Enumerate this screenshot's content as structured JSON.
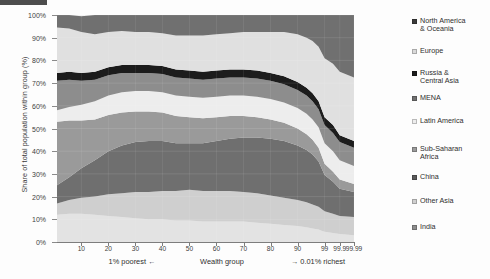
{
  "chart_data": {
    "type": "area",
    "title": "",
    "subtitle": "",
    "xlabel": "Wealth group",
    "ylabel": "Share of total population within group (%)",
    "stacked": true,
    "normalized": true,
    "grid": true,
    "legend_position": "right",
    "ylim": [
      0,
      100
    ],
    "ytick_labels": [
      "0%",
      "10%",
      "20%",
      "30%",
      "40%",
      "50%",
      "60%",
      "70%",
      "80%",
      "90%",
      "100%"
    ],
    "ytick_values": [
      0,
      10,
      20,
      30,
      40,
      50,
      60,
      70,
      80,
      90,
      100
    ],
    "xtick_labels": [
      "10",
      "20",
      "30",
      "40",
      "50",
      "60",
      "70",
      "80",
      "90",
      "99",
      "99.9",
      "99.99"
    ],
    "xtick_positions": [
      10,
      20,
      30,
      40,
      50,
      60,
      70,
      80,
      90,
      99,
      99.9,
      99.99
    ],
    "x_axis_note_left": "1% poorest ←",
    "x_axis_note_right": "→ 0.01% richest",
    "x": [
      0,
      5,
      10,
      15,
      20,
      25,
      30,
      35,
      40,
      45,
      50,
      55,
      60,
      65,
      70,
      75,
      80,
      85,
      90,
      93,
      95,
      97,
      98,
      99,
      99.5,
      99.9,
      99.99
    ],
    "series": [
      {
        "name": "India",
        "color": "#e3e3e3",
        "values": [
          12.0,
          12.5,
          12.5,
          12.0,
          11.5,
          11.0,
          10.5,
          10.0,
          10.0,
          9.5,
          9.5,
          9.0,
          9.0,
          9.0,
          9.0,
          8.5,
          8.0,
          7.5,
          7.0,
          6.5,
          6.0,
          5.5,
          5.0,
          4.5,
          4.0,
          3.5,
          3.0
        ]
      },
      {
        "name": "Other Asia",
        "color": "#cfcfcf",
        "values": [
          5.0,
          6.0,
          7.0,
          8.0,
          9.5,
          10.5,
          11.5,
          12.0,
          12.5,
          13.0,
          13.5,
          13.5,
          13.5,
          13.5,
          13.0,
          13.0,
          12.5,
          12.0,
          11.5,
          11.0,
          10.5,
          10.0,
          9.5,
          9.0,
          8.5,
          8.0,
          8.0
        ]
      },
      {
        "name": "China",
        "color": "#6f6f6f",
        "values": [
          8.0,
          10.0,
          13.0,
          16.0,
          19.0,
          21.0,
          22.0,
          22.5,
          22.0,
          21.0,
          20.5,
          21.0,
          22.0,
          23.0,
          24.0,
          24.5,
          25.0,
          25.0,
          24.0,
          23.0,
          22.0,
          20.0,
          18.0,
          16.0,
          14.0,
          12.0,
          11.0
        ]
      },
      {
        "name": "Sub-Saharan Africa",
        "color": "#9a9a9a",
        "values": [
          28.0,
          25.0,
          21.0,
          18.0,
          16.0,
          14.5,
          13.5,
          13.0,
          12.5,
          12.0,
          11.5,
          11.0,
          10.5,
          10.0,
          9.5,
          9.0,
          8.5,
          8.0,
          7.5,
          7.0,
          6.5,
          6.0,
          5.5,
          5.0,
          4.5,
          4.0,
          3.5
        ]
      },
      {
        "name": "Latin America",
        "color": "#ededed",
        "values": [
          5.0,
          6.0,
          7.0,
          8.0,
          8.5,
          9.0,
          9.0,
          9.0,
          9.0,
          9.0,
          9.0,
          9.0,
          9.0,
          9.0,
          9.0,
          9.0,
          9.0,
          9.0,
          9.0,
          9.0,
          9.0,
          9.0,
          9.0,
          9.0,
          9.0,
          8.5,
          8.0
        ]
      },
      {
        "name": "MENA",
        "color": "#8d8d8d",
        "values": [
          13.0,
          12.0,
          10.5,
          9.5,
          9.0,
          8.5,
          8.0,
          8.0,
          8.0,
          8.0,
          8.0,
          8.0,
          8.0,
          8.0,
          8.0,
          8.0,
          8.0,
          8.0,
          8.0,
          8.0,
          8.0,
          8.0,
          8.0,
          8.0,
          8.0,
          8.0,
          8.0
        ]
      },
      {
        "name": "Russia & Central Asia",
        "color": "#1c1c1c",
        "values": [
          3.5,
          3.5,
          3.5,
          3.5,
          3.5,
          3.5,
          3.5,
          3.5,
          3.5,
          3.5,
          3.5,
          3.5,
          3.5,
          3.5,
          3.5,
          3.5,
          3.5,
          3.5,
          3.5,
          3.5,
          3.5,
          3.5,
          3.5,
          3.5,
          3.5,
          3.0,
          3.0
        ]
      },
      {
        "name": "Europe",
        "color": "#e0e0e0",
        "values": [
          20.0,
          19.0,
          18.0,
          16.5,
          15.5,
          15.0,
          14.5,
          14.5,
          14.5,
          15.0,
          15.5,
          16.0,
          16.0,
          16.0,
          16.5,
          17.0,
          18.0,
          19.5,
          21.0,
          22.0,
          23.0,
          24.0,
          25.0,
          26.0,
          27.0,
          28.0,
          28.0
        ]
      },
      {
        "name": "North America & Oceania",
        "color": "#707070",
        "values": [
          5.5,
          6.0,
          7.0,
          8.5,
          7.5,
          7.5,
          7.5,
          7.5,
          8.0,
          9.0,
          9.0,
          9.0,
          8.5,
          8.0,
          7.5,
          7.5,
          7.5,
          7.5,
          8.5,
          10.0,
          11.5,
          14.0,
          16.5,
          19.0,
          21.5,
          25.0,
          27.5
        ]
      }
    ]
  },
  "legend": {
    "items": [
      {
        "label": "North America\n& Oceania",
        "color": "#3b3b3b"
      },
      {
        "label": "Europe",
        "color": "#d9d9d9"
      },
      {
        "label": "Russia &\nCentral Asia",
        "color": "#1c1c1c"
      },
      {
        "label": "MENA",
        "color": "#707070"
      },
      {
        "label": "Latin America",
        "color": "#ededed"
      },
      {
        "label": "Sub-Saharan\nAfrica",
        "color": "#9a9a9a"
      },
      {
        "label": "China",
        "color": "#5a5a5a"
      },
      {
        "label": "Other Asia",
        "color": "#cfcfcf"
      },
      {
        "label": "India",
        "color": "#8d8d8d"
      }
    ]
  },
  "axes": {
    "y_title": "Share of total population within group (%)",
    "x_title": "Wealth group",
    "x_note_left": "1% poorest ←",
    "x_note_right": "→ 0.01% richest"
  }
}
